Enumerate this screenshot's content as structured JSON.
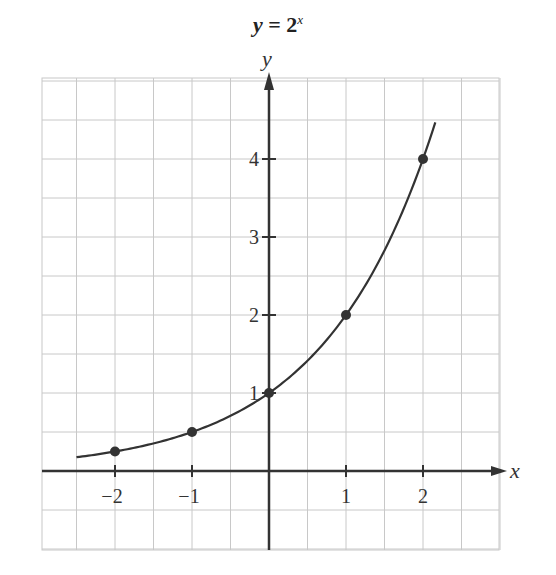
{
  "chart_data": {
    "type": "line",
    "title_parts": {
      "lhs": "y",
      "eq": " = ",
      "base": "2",
      "exp": "x"
    },
    "xlabel": "x",
    "ylabel": "y",
    "xlim": [
      -3,
      3
    ],
    "ylim": [
      -1,
      5
    ],
    "grid": true,
    "grid_step": 0.5,
    "x_ticks": [
      -2,
      -1,
      1,
      2
    ],
    "x_tick_labels": [
      "−2",
      "−1",
      "1",
      "2"
    ],
    "y_ticks": [
      1,
      2,
      3,
      4
    ],
    "y_tick_labels": [
      "1",
      "2",
      "3",
      "4"
    ],
    "curve": {
      "function": "2^x",
      "x_range": [
        -2.5,
        2.16
      ]
    },
    "points": [
      {
        "x": -2,
        "y": 0.25
      },
      {
        "x": -1,
        "y": 0.5
      },
      {
        "x": 0,
        "y": 1
      },
      {
        "x": 1,
        "y": 2
      },
      {
        "x": 2,
        "y": 4
      }
    ],
    "colors": {
      "grid": "#c8c8c8",
      "axis": "#333333",
      "curve": "#333333",
      "point": "#333333"
    }
  }
}
